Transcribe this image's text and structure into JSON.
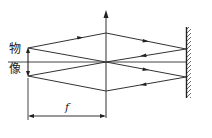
{
  "diagram": {
    "type": "optics-ray-diagram",
    "labels": {
      "object": "物",
      "image": "像",
      "focal_length": "f"
    },
    "elements": {
      "optical_axis": {
        "x1": 8,
        "y1": 62,
        "x2": 186,
        "y2": 62
      },
      "lens": {
        "x": 106,
        "y_top": 12,
        "y_bottom": 118,
        "arrowhead": "top"
      },
      "object_arrow": {
        "x": 28,
        "y_base": 62,
        "y_tip": 48
      },
      "image_arrow": {
        "x": 28,
        "y_base": 62,
        "y_tip": 76
      },
      "mirror": {
        "x": 186,
        "y_top": 27,
        "y_bottom": 98,
        "hatching_side": "right"
      },
      "dimension": {
        "x1": 28,
        "x2": 106,
        "y": 116
      }
    },
    "colors": {
      "line": "#333333",
      "background": "#ffffff"
    }
  }
}
